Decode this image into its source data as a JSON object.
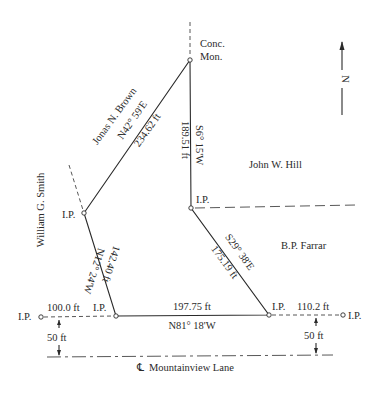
{
  "diagram": {
    "type": "property survey plat",
    "north_label": "N",
    "monument": {
      "line1": "Conc.",
      "line2": "Mon."
    },
    "iron_pin_label": "I.P.",
    "owners": {
      "north_west": "Jonas N. Brown",
      "west": "William G. Smith",
      "east_north": "John W. Hill",
      "east_south": "B.P. Farrar"
    },
    "courses": [
      {
        "id": "nw-side",
        "bearing": "N42° 59'E",
        "distance": "234.62 ft"
      },
      {
        "id": "east-upper",
        "bearing": "S6° 15'W",
        "distance": "189.51 ft"
      },
      {
        "id": "east-lower",
        "bearing": "S29° 38'E",
        "distance": "175.19 ft"
      },
      {
        "id": "south-side",
        "bearing": "N81° 18'W",
        "distance": "197.75 ft"
      },
      {
        "id": "west-side",
        "bearing": "N12° 24'W",
        "distance": "142.40 ft"
      }
    ],
    "offsets": {
      "left_frontage": "100.0 ft",
      "right_frontage": "110.2 ft",
      "left_setback": "50 ft",
      "right_setback": "50 ft"
    },
    "road": {
      "centerline_symbol": "℄",
      "name": "Mountainview Lane"
    }
  }
}
